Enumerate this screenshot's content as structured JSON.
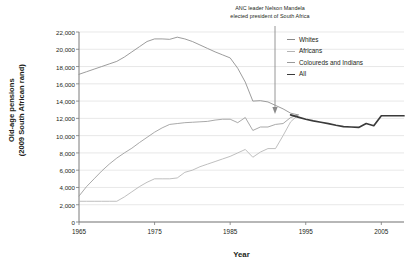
{
  "annotation": {
    "line1": "ANC leader Nelson Mandela",
    "line2": "elected president of South Africa"
  },
  "axes": {
    "ylabel_line1": "Old-age pensions",
    "ylabel_line2": "(2009 South African rand)",
    "xlabel": "Year",
    "yticks": [
      "22,000",
      "20,000",
      "18,000",
      "16,000",
      "14,000",
      "12,000",
      "10,000",
      "8,000",
      "6,000",
      "4,000",
      "2,000",
      "0"
    ],
    "xticks": [
      "1965",
      "1975",
      "1985",
      "1995",
      "2005"
    ]
  },
  "legend": {
    "items": [
      {
        "label": "Whites",
        "color": "#8a8a8a",
        "width": 0.9
      },
      {
        "label": "Africans",
        "color": "#b4b4b4",
        "width": 0.9
      },
      {
        "label": "Coloureds and Indians",
        "color": "#9a9a9a",
        "width": 0.9
      },
      {
        "label": "All",
        "color": "#3a3a3a",
        "width": 1.6
      }
    ]
  },
  "chart_data": {
    "type": "line",
    "title": "",
    "xlabel": "Year",
    "ylabel": "Old-age pensions (2009 South African rand)",
    "xlim": [
      1965,
      2008
    ],
    "ylim": [
      0,
      22000
    ],
    "grid": true,
    "legend_position": "top-right",
    "annotations": [
      {
        "text": "ANC leader Nelson Mandela elected president of South Africa",
        "x": 1994,
        "y": 12400,
        "type": "arrow"
      }
    ],
    "series": [
      {
        "name": "Whites",
        "color": "#8a8a8a",
        "x": [
          1965,
          1966,
          1967,
          1968,
          1969,
          1970,
          1971,
          1972,
          1973,
          1974,
          1975,
          1976,
          1977,
          1978,
          1979,
          1980,
          1981,
          1982,
          1983,
          1984,
          1985,
          1986,
          1987,
          1988,
          1989,
          1990,
          1991,
          1992,
          1993,
          1994
        ],
        "values": [
          17100,
          17400,
          17700,
          18000,
          18300,
          18600,
          19100,
          19700,
          20300,
          20900,
          21200,
          21200,
          21150,
          21400,
          21200,
          20900,
          20500,
          20100,
          19700,
          19350,
          19000,
          17800,
          16200,
          14000,
          14050,
          13900,
          13500,
          13100,
          12600,
          12400
        ]
      },
      {
        "name": "Africans",
        "color": "#b4b4b4",
        "x": [
          1965,
          1966,
          1967,
          1968,
          1969,
          1970,
          1971,
          1972,
          1973,
          1974,
          1975,
          1976,
          1977,
          1978,
          1979,
          1980,
          1981,
          1982,
          1983,
          1984,
          1985,
          1986,
          1987,
          1988,
          1989,
          1990,
          1991,
          1992,
          1993,
          1994
        ],
        "values": [
          2400,
          2400,
          2400,
          2400,
          2400,
          2400,
          2900,
          3500,
          4100,
          4600,
          5000,
          5000,
          5000,
          5100,
          5750,
          6000,
          6400,
          6700,
          7000,
          7300,
          7600,
          8000,
          8400,
          7500,
          8100,
          8500,
          8500,
          10000,
          11600,
          12400
        ]
      },
      {
        "name": "Coloureds and Indians",
        "color": "#9a9a9a",
        "x": [
          1965,
          1966,
          1967,
          1968,
          1969,
          1970,
          1971,
          1972,
          1973,
          1974,
          1975,
          1976,
          1977,
          1978,
          1979,
          1980,
          1981,
          1982,
          1983,
          1984,
          1985,
          1986,
          1987,
          1988,
          1989,
          1990,
          1991,
          1992,
          1993,
          1994
        ],
        "values": [
          3000,
          4100,
          5000,
          5900,
          6700,
          7400,
          8000,
          8550,
          9200,
          9800,
          10400,
          10900,
          11300,
          11400,
          11500,
          11550,
          11600,
          11650,
          11800,
          11900,
          11900,
          11500,
          12100,
          10600,
          11000,
          11000,
          11300,
          11400,
          12100,
          12400
        ]
      },
      {
        "name": "All",
        "color": "#3a3a3a",
        "x": [
          1993,
          1994,
          1995,
          1996,
          1997,
          1998,
          1999,
          2000,
          2001,
          2002,
          2003,
          2004,
          2005,
          2006,
          2007,
          2008
        ],
        "values": [
          12400,
          12150,
          11900,
          11700,
          11550,
          11400,
          11200,
          11050,
          11000,
          10950,
          11400,
          11150,
          12300,
          12300,
          12300,
          12300
        ]
      }
    ]
  }
}
